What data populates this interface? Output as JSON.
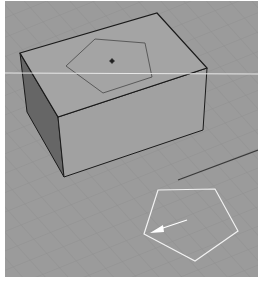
{
  "viewport": {
    "name": "3D perspective viewport",
    "background": "#9b9b9b",
    "grid_color": "#8e8e8e",
    "box": {
      "top_face_color": "#a3a3a3",
      "front_face_color": "#a0a0a0",
      "side_face_color": "#666666",
      "edge_color": "#1a1a1a"
    },
    "top_pentagon": {
      "stroke": "#5a5a5a",
      "center_marker": "#222222"
    },
    "drawn_pentagon": {
      "stroke": "#f2f2f2"
    },
    "direction_arrow": {
      "color": "#ffffff"
    },
    "horizon_line": {
      "color": "#e6e6e6"
    },
    "ground_edge_line": {
      "color": "#3a3a3a"
    }
  }
}
